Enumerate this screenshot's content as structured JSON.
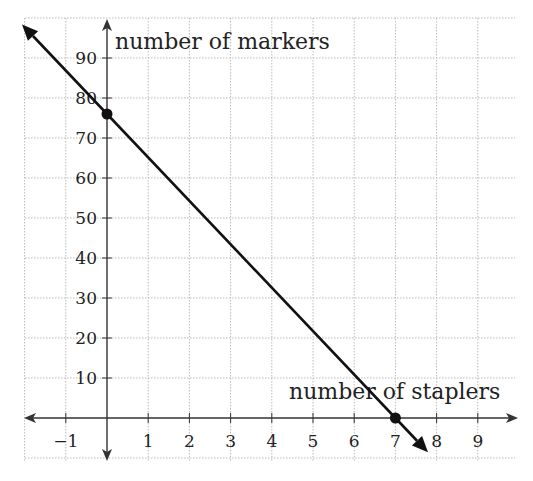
{
  "chart_data": {
    "type": "line",
    "title": "",
    "xlabel": "number of staplers",
    "ylabel": "number of markers",
    "xlim": [
      -1.9,
      10
    ],
    "ylim": [
      -10,
      97
    ],
    "x_ticks": [
      -1,
      1,
      2,
      3,
      4,
      5,
      6,
      7,
      8,
      9
    ],
    "x_tick_labels": [
      "−1",
      "1",
      "2",
      "3",
      "4",
      "5",
      "6",
      "7",
      "8",
      "9"
    ],
    "y_ticks": [
      10,
      20,
      30,
      40,
      50,
      60,
      70,
      80,
      90
    ],
    "y_tick_labels": [
      "10",
      "20",
      "30",
      "40",
      "50",
      "60",
      "70",
      "80",
      "90"
    ],
    "grid": true,
    "legend": null,
    "series": [
      {
        "name": "line",
        "color": "#111111",
        "x": [
          0,
          7
        ],
        "y": [
          76,
          0
        ],
        "arrows_both_ends": true
      }
    ],
    "points": [
      {
        "x": 0,
        "y": 76,
        "label": "y-intercept"
      },
      {
        "x": 7,
        "y": 0,
        "label": "x-intercept"
      }
    ]
  },
  "colors": {
    "axis": "#333333",
    "grid": "#bbbbbb",
    "line": "#111111",
    "point": "#111111"
  }
}
